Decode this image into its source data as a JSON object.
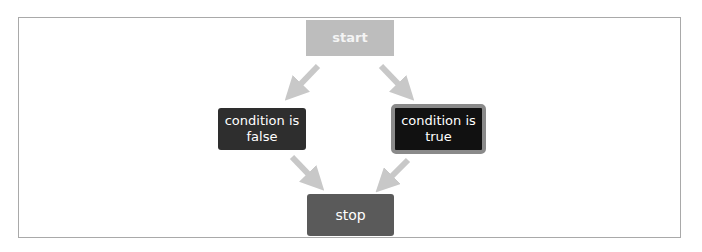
{
  "diagram": {
    "type": "flowchart",
    "nodes": {
      "start": {
        "label": "start",
        "color": "#bdbdbd"
      },
      "false": {
        "label": "condition is\nfalse",
        "line1": "condition is",
        "line2": "false",
        "color": "#2e2e2e"
      },
      "true": {
        "label": "condition is\ntrue",
        "line1": "condition is",
        "line2": "true",
        "color": "#111111",
        "border": "#8a8a8a"
      },
      "stop": {
        "label": "stop",
        "color": "#5a5a5a"
      }
    },
    "edges": [
      {
        "from": "start",
        "to": "condition is false"
      },
      {
        "from": "start",
        "to": "condition is true"
      },
      {
        "from": "condition is false",
        "to": "stop"
      },
      {
        "from": "condition is true",
        "to": "stop"
      }
    ],
    "arrow_color": "#c8c8c8"
  }
}
